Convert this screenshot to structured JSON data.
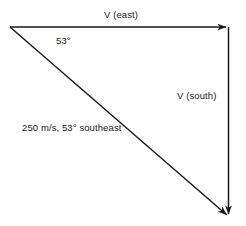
{
  "diagram": {
    "background_color": "#ffffff",
    "stroke_color": "#1b1b1b",
    "text_color": "#1b1b1b",
    "labels": {
      "east": "V (east)",
      "angle": "53°",
      "south": "V (south)",
      "resultant": "250 m/s, 53° southeast"
    },
    "vectors": [
      {
        "name": "east-vector",
        "label": "V (east)",
        "from": [
          10,
          27
        ],
        "to": [
          228,
          27
        ],
        "direction": "east"
      },
      {
        "name": "south-vector",
        "label": "V (south)",
        "from": [
          228,
          27
        ],
        "to": [
          228,
          216
        ],
        "direction": "south"
      },
      {
        "name": "resultant-vector",
        "label": "250 m/s, 53° southeast",
        "from": [
          10,
          27
        ],
        "to": [
          228,
          216
        ],
        "direction": "southeast",
        "magnitude": "250 m/s",
        "angle": "53°"
      }
    ]
  }
}
